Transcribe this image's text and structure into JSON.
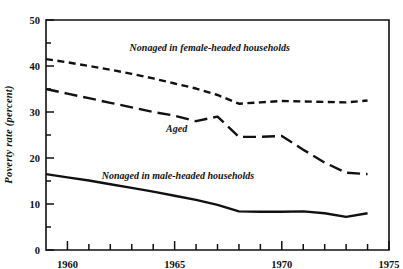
{
  "chart_data": {
    "type": "line",
    "title": "",
    "xlabel": "",
    "ylabel": "Poverty rate (percent)",
    "xlim": [
      1959,
      1975
    ],
    "ylim": [
      0,
      50
    ],
    "yticks": [
      0,
      10,
      20,
      30,
      40,
      50
    ],
    "ytick_labels": [
      "0",
      "10",
      "20",
      "30",
      "40",
      "50"
    ],
    "yminor_step": 5,
    "xticks": [
      1959,
      1960,
      1961,
      1962,
      1963,
      1964,
      1965,
      1966,
      1967,
      1968,
      1969,
      1970,
      1971,
      1972,
      1973,
      1974,
      1975
    ],
    "xtick_labels_shown": [
      "1960",
      "1965",
      "1970",
      "1975"
    ],
    "xtick_label_years": [
      1960,
      1965,
      1970,
      1975
    ],
    "grid": false,
    "legend": "inline-annotations",
    "series": [
      {
        "name": "Nonaged in female-headed households",
        "style": "short-dash",
        "x": [
          1959,
          1960,
          1961,
          1962,
          1963,
          1964,
          1965,
          1966,
          1967,
          1968,
          1969,
          1970,
          1971,
          1972,
          1973,
          1974
        ],
        "values": [
          41.5,
          40.8,
          40.0,
          39.2,
          38.3,
          37.3,
          36.2,
          35.1,
          33.7,
          31.8,
          32.1,
          32.4,
          32.3,
          32.2,
          32.1,
          32.5
        ]
      },
      {
        "name": "Aged",
        "style": "long-dash",
        "x": [
          1959,
          1960,
          1961,
          1962,
          1963,
          1964,
          1965,
          1966,
          1967,
          1968,
          1969,
          1970,
          1971,
          1972,
          1973,
          1974
        ],
        "values": [
          35.0,
          34.0,
          33.0,
          32.0,
          31.0,
          30.0,
          29.2,
          28.0,
          29.0,
          24.6,
          24.6,
          24.8,
          21.8,
          19.0,
          16.8,
          16.5
        ]
      },
      {
        "name": "Nonaged in male-headed households",
        "style": "solid",
        "x": [
          1959,
          1960,
          1961,
          1962,
          1963,
          1964,
          1965,
          1966,
          1967,
          1968,
          1969,
          1970,
          1971,
          1972,
          1973,
          1974
        ],
        "values": [
          16.5,
          15.8,
          15.1,
          14.3,
          13.5,
          12.7,
          11.8,
          10.9,
          9.8,
          8.4,
          8.3,
          8.3,
          8.4,
          8.0,
          7.2,
          8.0
        ]
      }
    ],
    "annotations": [
      {
        "text": "Nonaged in female-headed households",
        "x": 1962.9,
        "y": 43.2
      },
      {
        "text": "Aged",
        "x": 1964.6,
        "y": 25.6
      },
      {
        "text": "Nonaged in male-headed households",
        "x": 1961.6,
        "y": 15.4
      }
    ]
  }
}
